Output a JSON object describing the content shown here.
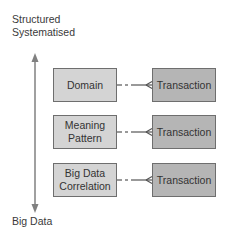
{
  "diagram": {
    "axis": {
      "top_label_line1": "Structured",
      "top_label_line2": "Systematised",
      "bottom_label": "Big Data",
      "arrow_color": "#808080"
    },
    "rows": [
      {
        "left_line1": "Domain",
        "left_line2": "",
        "right": "Transaction"
      },
      {
        "left_line1": "Meaning",
        "left_line2": "Pattern",
        "right": "Transaction"
      },
      {
        "left_line1": "Big Data",
        "left_line2": "Correlation",
        "right": "Transaction"
      }
    ],
    "colors": {
      "left_box_fill": "#d4d4d4",
      "right_box_fill": "#b5b5b5",
      "box_border": "#6e6e6e",
      "connector": "#555555"
    },
    "connector_type": "dashed-to-solid crow's-foot (one-to-many)"
  }
}
